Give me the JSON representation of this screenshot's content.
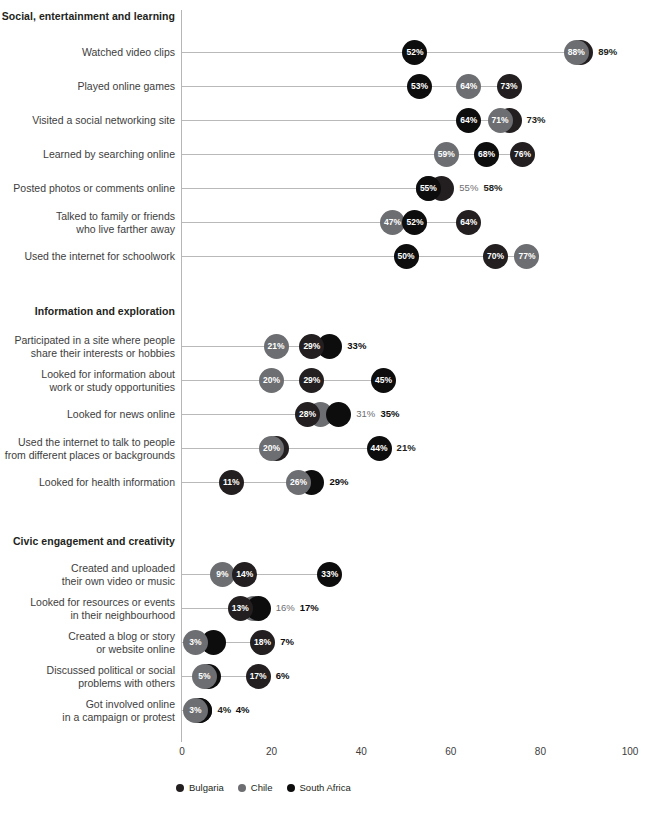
{
  "chart_data": {
    "type": "scatter",
    "title": "",
    "xlabel": "",
    "ylabel": "",
    "xlim": [
      0,
      100
    ],
    "xticks": [
      0,
      20,
      40,
      60,
      80,
      100
    ],
    "grid": false,
    "legend_position": "bottom",
    "series_colors": {
      "Bulgaria": "#231f20",
      "Chile": "#6d6e71",
      "South Africa": "#0d0d0d"
    },
    "legend": [
      {
        "label": "Bulgaria",
        "color": "#231f20"
      },
      {
        "label": "Chile",
        "color": "#6d6e71"
      },
      {
        "label": "South Africa",
        "color": "#0d0d0d"
      }
    ],
    "sections": [
      {
        "title": "Social, entertainment and learning",
        "rows": [
          {
            "label": "Watched video clips",
            "points": [
              {
                "series": "South Africa",
                "value": 52,
                "label": "52%",
                "inside": true
              },
              {
                "series": "Bulgaria",
                "value": 89,
                "label": "89%",
                "inside": false
              },
              {
                "series": "Chile",
                "value": 88,
                "label": "88%",
                "inside": true
              }
            ]
          },
          {
            "label": "Played online games",
            "points": [
              {
                "series": "South Africa",
                "value": 53,
                "label": "53%",
                "inside": true
              },
              {
                "series": "Chile",
                "value": 64,
                "label": "64%",
                "inside": true
              },
              {
                "series": "Bulgaria",
                "value": 73,
                "label": "73%",
                "inside": true
              }
            ]
          },
          {
            "label": "Visited a social networking site",
            "points": [
              {
                "series": "South Africa",
                "value": 64,
                "label": "64%",
                "inside": true
              },
              {
                "series": "Bulgaria",
                "value": 73,
                "label": "73%",
                "inside": false
              },
              {
                "series": "Chile",
                "value": 71,
                "label": "71%",
                "inside": true
              }
            ]
          },
          {
            "label": "Learned by searching online",
            "points": [
              {
                "series": "Chile",
                "value": 59,
                "label": "59%",
                "inside": true
              },
              {
                "series": "South Africa",
                "value": 68,
                "label": "68%",
                "inside": true
              },
              {
                "series": "Bulgaria",
                "value": 76,
                "label": "76%",
                "inside": true
              }
            ]
          },
          {
            "label": "Posted photos or comments online",
            "points": [
              {
                "series": "Chile",
                "value": 55,
                "label": "55%",
                "inside": false
              },
              {
                "series": "South Africa",
                "value": 55,
                "label": "55%",
                "inside": true
              },
              {
                "series": "Bulgaria",
                "value": 58,
                "label": "58%",
                "inside": false
              }
            ]
          },
          {
            "label": "Talked to family or friends\nwho live farther away",
            "points": [
              {
                "series": "Chile",
                "value": 47,
                "label": "47%",
                "inside": true
              },
              {
                "series": "South Africa",
                "value": 52,
                "label": "52%",
                "inside": true
              },
              {
                "series": "Bulgaria",
                "value": 64,
                "label": "64%",
                "inside": true
              }
            ]
          },
          {
            "label": "Used the internet for schoolwork",
            "points": [
              {
                "series": "South Africa",
                "value": 50,
                "label": "50%",
                "inside": true
              },
              {
                "series": "Bulgaria",
                "value": 70,
                "label": "70%",
                "inside": true
              },
              {
                "series": "Chile",
                "value": 77,
                "label": "77%",
                "inside": true
              }
            ]
          }
        ]
      },
      {
        "title": "Information and exploration",
        "rows": [
          {
            "label": "Participated in a site where people\nshare their interests or hobbies",
            "points": [
              {
                "series": "Chile",
                "value": 21,
                "label": "21%",
                "inside": true
              },
              {
                "series": "Bulgaria",
                "value": 29,
                "label": "29%",
                "inside": true
              },
              {
                "series": "South Africa",
                "value": 33,
                "label": "33%",
                "inside": false
              }
            ]
          },
          {
            "label": "Looked for information about\nwork or study opportunities",
            "points": [
              {
                "series": "Chile",
                "value": 20,
                "label": "20%",
                "inside": true
              },
              {
                "series": "Bulgaria",
                "value": 29,
                "label": "29%",
                "inside": true
              },
              {
                "series": "South Africa",
                "value": 45,
                "label": "45%",
                "inside": true
              }
            ]
          },
          {
            "label": "Looked for news online",
            "points": [
              {
                "series": "Bulgaria",
                "value": 28,
                "label": "28%",
                "inside": true
              },
              {
                "series": "Chile",
                "value": 31,
                "label": "31%",
                "inside": false
              },
              {
                "series": "South Africa",
                "value": 35,
                "label": "35%",
                "inside": false
              }
            ]
          },
          {
            "label": "Used the internet to talk to people\nfrom different places or backgrounds",
            "points": [
              {
                "series": "Chile",
                "value": 20,
                "label": "20%",
                "inside": true
              },
              {
                "series": "Bulgaria",
                "value": 21,
                "label": "21%",
                "inside": false
              },
              {
                "series": "South Africa",
                "value": 44,
                "label": "44%",
                "inside": true
              }
            ]
          },
          {
            "label": "Looked for health information",
            "points": [
              {
                "series": "Bulgaria",
                "value": 11,
                "label": "11%",
                "inside": true
              },
              {
                "series": "Chile",
                "value": 26,
                "label": "26%",
                "inside": true
              },
              {
                "series": "South Africa",
                "value": 29,
                "label": "29%",
                "inside": false
              }
            ]
          }
        ]
      },
      {
        "title": "Civic engagement and creativity",
        "rows": [
          {
            "label": "Created and uploaded\ntheir own video or music",
            "points": [
              {
                "series": "Chile",
                "value": 9,
                "label": "9%",
                "inside": true
              },
              {
                "series": "Bulgaria",
                "value": 14,
                "label": "14%",
                "inside": true
              },
              {
                "series": "South Africa",
                "value": 33,
                "label": "33%",
                "inside": true
              }
            ]
          },
          {
            "label": "Looked for resources or events\nin their neighbourhood",
            "points": [
              {
                "series": "Bulgaria",
                "value": 13,
                "label": "13%",
                "inside": true
              },
              {
                "series": "South Africa",
                "value": 17,
                "label": "17%",
                "inside": false
              },
              {
                "series": "Chile",
                "value": 16,
                "label": "16%",
                "inside": false
              }
            ]
          },
          {
            "label": "Created a blog or story\nor website online",
            "points": [
              {
                "series": "Chile",
                "value": 3,
                "label": "3%",
                "inside": true
              },
              {
                "series": "South Africa",
                "value": 7,
                "label": "7%",
                "inside": false
              },
              {
                "series": "Bulgaria",
                "value": 18,
                "label": "18%",
                "inside": true
              }
            ]
          },
          {
            "label": "Discussed political or social\nproblems with others",
            "points": [
              {
                "series": "Chile",
                "value": 5,
                "label": "5%",
                "inside": true
              },
              {
                "series": "South Africa",
                "value": 6,
                "label": "6%",
                "inside": false
              },
              {
                "series": "Bulgaria",
                "value": 17,
                "label": "17%",
                "inside": true
              }
            ]
          },
          {
            "label": "Got involved online\nin a campaign or protest",
            "points": [
              {
                "series": "Chile",
                "value": 3,
                "label": "3%",
                "inside": true
              },
              {
                "series": "Bulgaria",
                "value": 4,
                "label": "4%",
                "inside": false
              },
              {
                "series": "South Africa",
                "value": 4,
                "label": "4%",
                "inside": false
              }
            ]
          }
        ]
      }
    ]
  }
}
